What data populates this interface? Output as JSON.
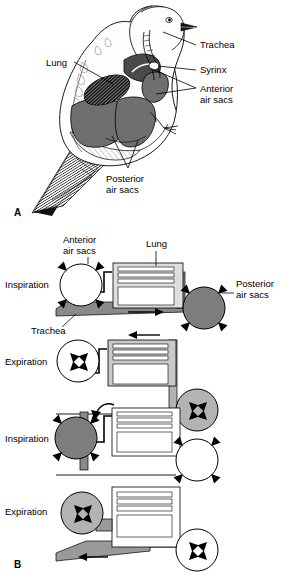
{
  "figure": {
    "title_a": "A",
    "title_b": "B",
    "panel_a": {
      "letter": "A",
      "subject": "bird-respiratory-anatomy",
      "labels": [
        {
          "id": "lung",
          "text": "Lung",
          "x": 46,
          "y": 62
        },
        {
          "id": "trachea",
          "text": "Trachea",
          "x": 198,
          "y": 48
        },
        {
          "id": "syrinx",
          "text": "Syrinx",
          "x": 198,
          "y": 73
        },
        {
          "id": "anterior-air-sacs",
          "text": "Anterior",
          "text2": "air sacs",
          "x": 198,
          "y": 92
        },
        {
          "id": "posterior-air-sacs",
          "text": "Posterior",
          "text2": "air sacs",
          "x": 112,
          "y": 178
        }
      ]
    },
    "panel_b": {
      "letter": "B",
      "top_labels": [
        {
          "id": "anterior-air-sacs",
          "line1": "Anterior",
          "line2": "air sacs"
        },
        {
          "id": "lung",
          "line1": "Lung",
          "line2": ""
        }
      ],
      "side_labels": [
        {
          "id": "posterior-air-sacs",
          "line1": "Posterior",
          "line2": "air sacs"
        },
        {
          "id": "trachea",
          "line1": "Trachea",
          "line2": ""
        }
      ],
      "steps": [
        {
          "id": "step-1",
          "phase": "Inspiration",
          "anterior_sac_state": "empty",
          "anterior_sac_fill": "#ffffff",
          "anterior_arrows": "outward",
          "posterior_sac_state": "filled",
          "posterior_sac_fill": "#7d7d7d",
          "posterior_arrows": "outward",
          "airflow_direction": "right",
          "airflow_arrow": "→"
        },
        {
          "id": "step-2",
          "phase": "Expiration",
          "anterior_sac_state": "empty",
          "anterior_sac_fill": "#ffffff",
          "anterior_arrows": "inward",
          "posterior_sac_state": "filled",
          "posterior_sac_fill": "#b3b3b3",
          "posterior_arrows": "inward",
          "airflow_direction": "left",
          "airflow_arrow": "←"
        },
        {
          "id": "step-3",
          "phase": "Inspiration",
          "anterior_sac_state": "filled",
          "anterior_sac_fill": "#7d7d7d",
          "anterior_arrows": "outward",
          "posterior_sac_state": "empty",
          "posterior_sac_fill": "#ffffff",
          "posterior_arrows": "outward",
          "airflow_direction": "none",
          "airflow_arrow": ""
        },
        {
          "id": "step-4",
          "phase": "Expiration",
          "anterior_sac_state": "filled",
          "anterior_sac_fill": "#b3b3b3",
          "anterior_arrows": "inward",
          "posterior_sac_state": "empty",
          "posterior_sac_fill": "#ffffff",
          "posterior_arrows": "inward",
          "airflow_direction": "left",
          "airflow_arrow": "←"
        }
      ]
    },
    "colors": {
      "air_dark": "#7d7d7d",
      "air_mid": "#b3b3b3",
      "air_light": "#d9d9d9",
      "outline": "#000000",
      "background": "#ffffff"
    }
  }
}
